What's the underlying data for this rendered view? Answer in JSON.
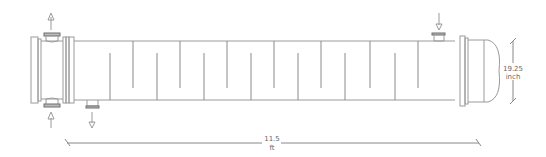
{
  "diagram": {
    "type": "shell-and-tube-heat-exchanger",
    "colors": {
      "stroke": "#9a9a9a",
      "dark": "#6e6e6e",
      "background": "#ffffff"
    },
    "dimensions": {
      "length": {
        "value": "11.5",
        "unit": "ft"
      },
      "diameter": {
        "value": "19.25",
        "unit": "inch"
      }
    },
    "nozzles": [
      {
        "id": "tube-outlet-top",
        "direction": "up"
      },
      {
        "id": "tube-inlet-bottom",
        "direction": "up"
      },
      {
        "id": "shell-outlet-bottom",
        "direction": "down"
      },
      {
        "id": "shell-inlet-top",
        "direction": "down"
      }
    ],
    "baffles": {
      "top": [
        133,
        180,
        227,
        274,
        321,
        370,
        418
      ],
      "bottom": [
        110,
        157,
        204,
        251,
        298,
        345,
        395
      ]
    }
  }
}
